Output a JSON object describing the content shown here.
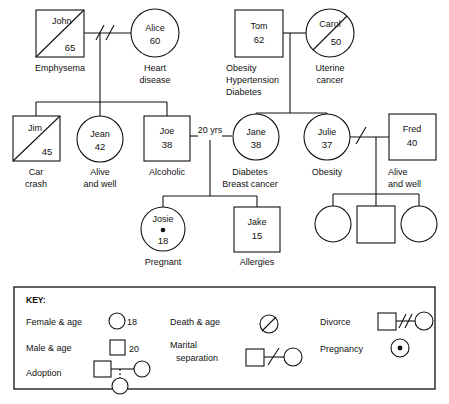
{
  "diagram": {
    "type": "genogram"
  },
  "people": {
    "john": {
      "name": "John",
      "age": "65",
      "condition_line1": "Emphysema",
      "condition_line2": ""
    },
    "alice": {
      "name": "Alice",
      "age": "60",
      "condition_line1": "Heart",
      "condition_line2": "disease"
    },
    "tom": {
      "name": "Tom",
      "age": "62",
      "condition_line1": "Obesity",
      "condition_line2": "Hypertension",
      "condition_line3": "Diabetes"
    },
    "carol": {
      "name": "Carol",
      "age": "50",
      "condition_line1": "Uterine",
      "condition_line2": "cancer"
    },
    "jim": {
      "name": "Jim",
      "age": "45",
      "condition_line1": "Car",
      "condition_line2": "crash"
    },
    "jean": {
      "name": "Jean",
      "age": "42",
      "condition_line1": "Alive",
      "condition_line2": "and well"
    },
    "joe": {
      "name": "Joe",
      "age": "38",
      "condition_line1": "Alcoholic",
      "condition_line2": ""
    },
    "jane": {
      "name": "Jane",
      "age": "38",
      "condition_line1": "Diabetes",
      "condition_line2": "Breast cancer"
    },
    "julie": {
      "name": "Julie",
      "age": "37",
      "condition_line1": "Obesity",
      "condition_line2": ""
    },
    "fred": {
      "name": "Fred",
      "age": "40",
      "condition_line1": "Alive",
      "condition_line2": "and well"
    },
    "josie": {
      "name": "Josie",
      "age": "18",
      "condition_line1": "Pregnant",
      "condition_line2": ""
    },
    "jake": {
      "name": "Jake",
      "age": "15",
      "condition_line1": "Allergies",
      "condition_line2": ""
    }
  },
  "relationships": {
    "joe_jane_duration": "20 yrs"
  },
  "key": {
    "title": "KEY:",
    "items": [
      {
        "label": "Female & age",
        "value": "18"
      },
      {
        "label": "Male & age",
        "value": "20"
      },
      {
        "label": "Adoption",
        "value": ""
      },
      {
        "label": "Death & age",
        "value": ""
      },
      {
        "label": "Marital",
        "label2": "separation",
        "value": ""
      },
      {
        "label": "Divorce",
        "value": ""
      },
      {
        "label": "Pregnancy",
        "value": ""
      }
    ]
  },
  "colors": {
    "ink": "#111111",
    "paper": "#ffffff"
  }
}
